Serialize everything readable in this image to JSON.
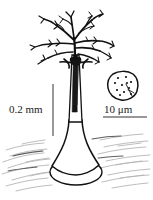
{
  "figure": {
    "background_color": "#ffffff",
    "ink_color": "#111111",
    "faint_ink_color": "#9a9a9a",
    "width": 153,
    "height": 200
  },
  "scale_bars": {
    "vertical": {
      "label": "0.2 mm",
      "orientation": "vertical",
      "x": 53,
      "y_top": 84,
      "y_bottom": 136,
      "length_px": 52,
      "color": "#555555"
    },
    "horizontal": {
      "label": "10 μm",
      "orientation": "horizontal",
      "y": 117,
      "x_left": 103,
      "x_right": 147,
      "length_px": 44,
      "color": "#333333"
    }
  },
  "inset": {
    "name": "cell-detail-inset",
    "shape": "rounded-irregular-polygon",
    "center_x": 123,
    "center_y": 86,
    "radius": 15,
    "granule_count": 11,
    "granules": [
      [
        118,
        78
      ],
      [
        126,
        77
      ],
      [
        131,
        82
      ],
      [
        115,
        83
      ],
      [
        122,
        85
      ],
      [
        129,
        88
      ],
      [
        117,
        90
      ],
      [
        124,
        92
      ],
      [
        131,
        94
      ],
      [
        120,
        95
      ],
      [
        127,
        83
      ]
    ],
    "flagellum_path": "M126,84 L131,95 M128,90 L133,92"
  },
  "structure": {
    "crown": {
      "name": "branching-crown",
      "description": "dichotomously branching arms radiating from stalk apex",
      "branch_count": 9,
      "top_y": 9,
      "span_x": [
        28,
        118
      ]
    },
    "collar": {
      "name": "collar-whorl",
      "y": 62,
      "x": 72,
      "width": 26
    },
    "stalk": {
      "name": "stalk",
      "top_y": 55,
      "bottom_y": 160,
      "x": 73,
      "top_width": 5,
      "description": "dark tapering stalk widening to a flared base"
    },
    "holdfast": {
      "name": "holdfast-base",
      "center_x": 76,
      "center_y": 172,
      "rx": 26,
      "ry": 13,
      "description": "bell shaped foot resting on an elliptical disc"
    },
    "substrate": {
      "name": "substrate-hatching",
      "description": "faint gray hatch strokes indicating surface",
      "stroke_color": "#a8a8a8",
      "stroke_count": 22
    }
  }
}
